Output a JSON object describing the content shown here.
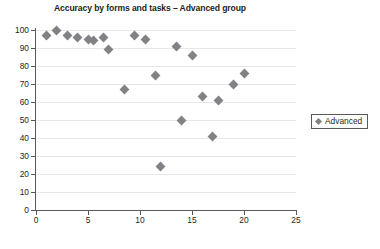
{
  "chart_data": {
    "type": "scatter",
    "title": "Accuracy by forms and tasks – Advanced group",
    "xlabel": "",
    "ylabel": "",
    "xlim": [
      0,
      25
    ],
    "ylim": [
      0,
      100
    ],
    "xticks": [
      0,
      5,
      10,
      15,
      20,
      25
    ],
    "yticks": [
      0,
      10,
      20,
      30,
      40,
      50,
      60,
      70,
      80,
      90,
      100
    ],
    "grid": true,
    "legend_position": "right",
    "series": [
      {
        "name": "Advanced",
        "color": "#808285",
        "marker": "diamond",
        "points": [
          {
            "x": 1,
            "y": 97
          },
          {
            "x": 2,
            "y": 100
          },
          {
            "x": 3,
            "y": 97
          },
          {
            "x": 4,
            "y": 96
          },
          {
            "x": 5,
            "y": 95
          },
          {
            "x": 5.5,
            "y": 94
          },
          {
            "x": 6.5,
            "y": 96
          },
          {
            "x": 7,
            "y": 89
          },
          {
            "x": 8.5,
            "y": 67
          },
          {
            "x": 9.5,
            "y": 97
          },
          {
            "x": 10.5,
            "y": 95
          },
          {
            "x": 11.5,
            "y": 75
          },
          {
            "x": 12,
            "y": 24
          },
          {
            "x": 13.5,
            "y": 91
          },
          {
            "x": 14,
            "y": 50
          },
          {
            "x": 15,
            "y": 86
          },
          {
            "x": 16,
            "y": 63
          },
          {
            "x": 17,
            "y": 41
          },
          {
            "x": 17.5,
            "y": 61
          },
          {
            "x": 19,
            "y": 70
          },
          {
            "x": 20,
            "y": 76
          }
        ]
      }
    ]
  },
  "legend": {
    "items": [
      {
        "label": "Advanced"
      }
    ]
  }
}
